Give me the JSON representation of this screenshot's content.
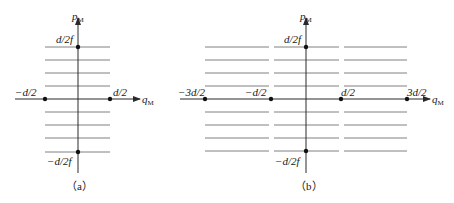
{
  "colors": {
    "axis": "#2a2a2a",
    "levels": "#808080",
    "dots": "#111111",
    "background": "#ffffff"
  },
  "panel_a": {
    "caption": "（a）",
    "axis_x_label": "q",
    "axis_x_sub": "M",
    "axis_y_label": "p",
    "axis_y_sub": "M",
    "tick_left": "−d/2",
    "tick_right": "d/2",
    "tick_top": "d/2f",
    "tick_bottom": "−d/2f",
    "level_lines_above": 4,
    "level_lines_below": 4
  },
  "panel_b": {
    "caption": "（b）",
    "axis_x_label": "q",
    "axis_x_sub": "M",
    "axis_y_label": "p",
    "axis_y_sub": "M",
    "tick_far_left": "−3d/2",
    "tick_left": "−d/2",
    "tick_right": "d/2",
    "tick_far_right": "3d/2",
    "tick_top": "d/2f",
    "tick_bottom": "−d/2f",
    "segment_groups": 3,
    "level_lines_above": 4,
    "level_lines_below": 4
  }
}
